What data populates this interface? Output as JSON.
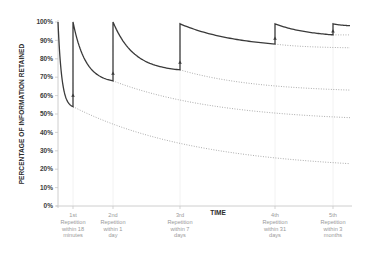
{
  "chart_data": {
    "type": "line",
    "title": "",
    "xlabel": "TIME",
    "ylabel": "PERCENTAGE OF INFORMATION RETAINED",
    "ylim": [
      0,
      100
    ],
    "yticks": [
      "0%",
      "10%",
      "20%",
      "30%",
      "40%",
      "50%",
      "60%",
      "70%",
      "80%",
      "90%",
      "100%"
    ],
    "grid": "faint vertical lines at repetition points",
    "legend": "none",
    "repetitions": [
      {
        "label_lines": [
          "1st",
          "Repetition",
          "within 18",
          "minutes"
        ],
        "retained_before": 54,
        "retained_after": 100,
        "marker": 60
      },
      {
        "label_lines": [
          "2nd",
          "Repetition",
          "within 1",
          "day"
        ],
        "retained_before": 68,
        "retained_after": 100,
        "marker": 72
      },
      {
        "label_lines": [
          "3rd",
          "Repetition",
          "within 7",
          "days"
        ],
        "retained_before": 74,
        "retained_after": 99,
        "marker": 78
      },
      {
        "label_lines": [
          "4th",
          "Repetition",
          "within 31",
          "days"
        ],
        "retained_before": 88,
        "retained_after": 99,
        "marker": 91
      },
      {
        "label_lines": [
          "5th",
          "Repetition",
          "within 3",
          "months"
        ],
        "retained_before": 93,
        "retained_after": 99,
        "marker": 95
      }
    ],
    "series": [
      {
        "name": "retention with repetition",
        "style": "solid",
        "description": "sawtooth forgetting curve, resets near 100% at each repetition, ends ~98%"
      },
      {
        "name": "decay after 1st repetition point (no review)",
        "style": "dotted",
        "start": 54,
        "end": 23
      },
      {
        "name": "decay after 2nd repetition point (no review)",
        "style": "dotted",
        "start": 68,
        "end": 48
      },
      {
        "name": "decay after 3rd repetition point (no review)",
        "style": "dotted",
        "start": 74,
        "end": 63
      },
      {
        "name": "decay after 4th repetition point (no review)",
        "style": "dotted",
        "start": 88,
        "end": 86
      },
      {
        "name": "decay after 5th repetition point (no review)",
        "style": "dotted",
        "start": 93,
        "end": 93
      }
    ]
  },
  "colors": {
    "curve": "#3a3a3a",
    "dotted": "#9a9a9a",
    "axis": "#c8c8c8",
    "grid": "#efefef",
    "tick_label": "#3a3a3a",
    "x_label_text": "#9a9a9a"
  }
}
